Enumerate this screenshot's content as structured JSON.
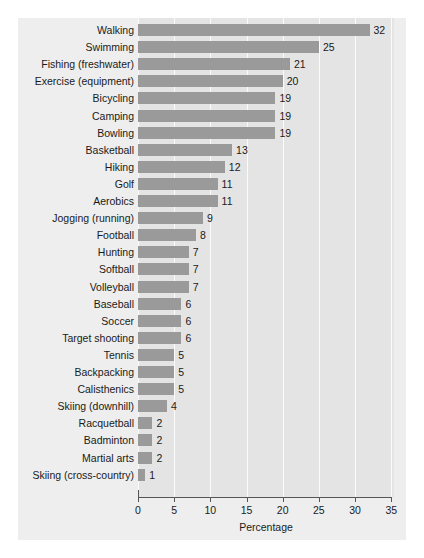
{
  "chart_data": {
    "type": "bar",
    "orientation": "horizontal",
    "title": "",
    "xlabel": "Percentage",
    "ylabel": "",
    "xlim": [
      0,
      35
    ],
    "xticks": [
      0,
      5,
      10,
      15,
      20,
      25,
      30,
      35
    ],
    "grid": "vertical",
    "legend": "none",
    "bar_color": "#9a9a9a",
    "plot_background": "#e4e4e4",
    "figure_background": "#eeeeee",
    "categories": [
      "Walking",
      "Swimming",
      "Fishing (freshwater)",
      "Exercise (equipment)",
      "Bicycling",
      "Camping",
      "Bowling",
      "Basketball",
      "Hiking",
      "Golf",
      "Aerobics",
      "Jogging (running)",
      "Football",
      "Hunting",
      "Softball",
      "Volleyball",
      "Baseball",
      "Soccer",
      "Target shooting",
      "Tennis",
      "Backpacking",
      "Calisthenics",
      "Skiing (downhill)",
      "Racquetball",
      "Badminton",
      "Martial arts",
      "Skiing (cross-country)"
    ],
    "values": [
      32,
      25,
      21,
      20,
      19,
      19,
      19,
      13,
      12,
      11,
      11,
      9,
      8,
      7,
      7,
      7,
      6,
      6,
      6,
      5,
      5,
      5,
      4,
      2,
      2,
      2,
      1
    ],
    "value_labels": [
      "32",
      "25",
      "21",
      "20",
      "19",
      "19",
      "19",
      "13",
      "12",
      "11",
      "11",
      "9",
      "8",
      "7",
      "7",
      "7",
      "6",
      "6",
      "6",
      "5",
      "5",
      "5",
      "4",
      "2",
      "2",
      "2",
      "1"
    ],
    "tick_labels": [
      "0",
      "5",
      "10",
      "15",
      "20",
      "25",
      "30",
      "35"
    ]
  }
}
